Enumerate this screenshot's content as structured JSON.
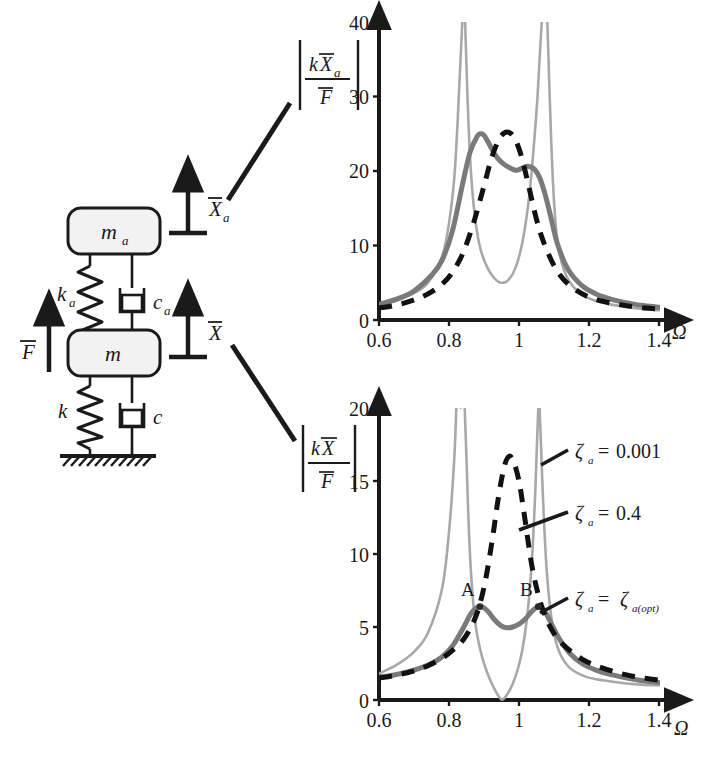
{
  "figure": {
    "colors": {
      "curve_light": "#a8a8a8",
      "curve_dark": "#7a7a7a",
      "curve_dashed": "#111111",
      "axis": "#1a1a1a",
      "mass_fill": "#f2f2f2",
      "stroke": "#1a1a1a"
    }
  },
  "schematic": {
    "name": "two-degree-of-freedom vibration absorber",
    "absorber_mass_label": "m",
    "absorber_mass_sub": "a",
    "absorber_spring_label": "k",
    "absorber_spring_sub": "a",
    "absorber_damper_label": "c",
    "absorber_damper_sub": "a",
    "primary_mass_label": "m",
    "primary_spring_label": "k",
    "primary_damper_label": "c",
    "force_label": "F",
    "disp_absorber_label": "X",
    "disp_absorber_sub": "a",
    "disp_primary_label": "X"
  },
  "chart_data": [
    {
      "id": "top",
      "type": "line",
      "title": "",
      "ylabel_parts": {
        "num_k": "k",
        "num_X": "X",
        "num_sub": "a",
        "den": "F"
      },
      "ylabel": "|kX_a / F|",
      "xlabel": "Ω",
      "xlim": [
        0.6,
        1.4
      ],
      "ylim": [
        0,
        40
      ],
      "xticks": [
        "0.6",
        "0.8",
        "1",
        "1.2",
        "1.4"
      ],
      "xtick_values": [
        0.6,
        0.8,
        1.0,
        1.2,
        1.4
      ],
      "yticks": [
        "0",
        "10",
        "20",
        "30",
        "40"
      ],
      "ytick_values": [
        0,
        10,
        20,
        30,
        40
      ],
      "grid": false,
      "series": [
        {
          "name": "ζa = 0.001",
          "style": "solid-light",
          "color": "#a8a8a8",
          "x": [
            0.6,
            0.65,
            0.7,
            0.74,
            0.78,
            0.8,
            0.815,
            0.825,
            0.832,
            0.838,
            0.842,
            0.846,
            0.85,
            0.856,
            0.864,
            0.875,
            0.89,
            0.91,
            0.93,
            0.95,
            0.97,
            0.99,
            1.01,
            1.03,
            1.05,
            1.06,
            1.068,
            1.074,
            1.079,
            1.083,
            1.087,
            1.092,
            1.1,
            1.11,
            1.13,
            1.16,
            1.2,
            1.25,
            1.3,
            1.35,
            1.4
          ],
          "y": [
            2.0,
            2.6,
            3.6,
            5.0,
            8.5,
            13.0,
            19.0,
            27.0,
            34.0,
            40.0,
            44.0,
            40.0,
            34.0,
            26.0,
            19.0,
            13.5,
            9.5,
            7.0,
            5.6,
            5.0,
            5.4,
            7.0,
            10.5,
            17.0,
            28.0,
            36.0,
            42.0,
            44.0,
            42.0,
            37.0,
            31.0,
            24.0,
            16.0,
            10.5,
            6.5,
            4.2,
            2.9,
            2.2,
            1.8,
            1.5,
            1.3
          ]
        },
        {
          "name": "ζa = ζa(opt)",
          "style": "solid-dark",
          "color": "#7a7a7a",
          "x": [
            0.6,
            0.65,
            0.7,
            0.75,
            0.78,
            0.81,
            0.84,
            0.86,
            0.88,
            0.89,
            0.9,
            0.915,
            0.93,
            0.945,
            0.96,
            0.975,
            0.99,
            1.0,
            1.01,
            1.02,
            1.03,
            1.045,
            1.06,
            1.075,
            1.09,
            1.11,
            1.14,
            1.18,
            1.22,
            1.27,
            1.32,
            1.36,
            1.4
          ],
          "y": [
            2.1,
            2.8,
            3.9,
            6.0,
            8.0,
            12.0,
            18.5,
            22.5,
            24.6,
            25.0,
            24.8,
            23.6,
            22.3,
            21.4,
            20.8,
            20.4,
            20.1,
            20.2,
            20.4,
            20.6,
            20.6,
            20.2,
            19.0,
            16.8,
            14.0,
            10.2,
            6.8,
            4.6,
            3.5,
            2.7,
            2.2,
            1.9,
            1.7
          ]
        },
        {
          "name": "ζa = 0.4",
          "style": "dashed",
          "color": "#111111",
          "x": [
            0.6,
            0.65,
            0.7,
            0.74,
            0.78,
            0.81,
            0.84,
            0.87,
            0.9,
            0.92,
            0.94,
            0.955,
            0.97,
            0.985,
            1.0,
            1.015,
            1.03,
            1.05,
            1.07,
            1.1,
            1.13,
            1.17,
            1.21,
            1.26,
            1.31,
            1.36,
            1.4
          ],
          "y": [
            1.6,
            2.0,
            2.7,
            3.5,
            4.8,
            6.4,
            9.0,
            13.0,
            18.0,
            21.5,
            24.0,
            25.0,
            25.2,
            24.6,
            23.0,
            20.5,
            17.5,
            13.5,
            10.5,
            7.3,
            5.3,
            3.8,
            2.9,
            2.3,
            1.9,
            1.6,
            1.5
          ]
        }
      ]
    },
    {
      "id": "bottom",
      "type": "line",
      "title": "",
      "ylabel_parts": {
        "num_k": "k",
        "num_X": "X",
        "den": "F"
      },
      "ylabel": "|kX / F|",
      "xlabel": "Ω",
      "xlim": [
        0.6,
        1.4
      ],
      "ylim": [
        0,
        20
      ],
      "xticks": [
        "0.6",
        "0.8",
        "1",
        "1.2",
        "1.4"
      ],
      "xtick_values": [
        0.6,
        0.8,
        1.0,
        1.2,
        1.4
      ],
      "yticks": [
        "0",
        "5",
        "10",
        "15",
        "20"
      ],
      "ytick_values": [
        0,
        5,
        10,
        15,
        20
      ],
      "grid": false,
      "annotations": [
        {
          "text": "A",
          "x": 0.888,
          "y": 6.4
        },
        {
          "text": "B",
          "x": 1.055,
          "y": 6.4
        }
      ],
      "series": [
        {
          "name": "ζa = 0.001",
          "style": "solid-light",
          "color": "#a8a8a8",
          "x": [
            0.6,
            0.65,
            0.7,
            0.74,
            0.78,
            0.8,
            0.815,
            0.825,
            0.833,
            0.84,
            0.845,
            0.85,
            0.857,
            0.866,
            0.878,
            0.895,
            0.912,
            0.928,
            0.94,
            0.948,
            0.952,
            0.958,
            0.968,
            0.982,
            1.0,
            1.015,
            1.028,
            1.038,
            1.046,
            1.052,
            1.057,
            1.062,
            1.07,
            1.08,
            1.095,
            1.115,
            1.145,
            1.19,
            1.24,
            1.3,
            1.35,
            1.4
          ],
          "y": [
            1.8,
            2.4,
            3.3,
            4.6,
            7.6,
            11.5,
            16.5,
            22.0,
            20.0,
            22.0,
            20.0,
            16.5,
            11.5,
            7.6,
            4.8,
            2.9,
            1.7,
            0.85,
            0.32,
            0.08,
            0.02,
            0.12,
            0.45,
            1.1,
            2.4,
            4.2,
            6.8,
            10.0,
            14.0,
            18.0,
            20.5,
            18.0,
            13.0,
            8.6,
            5.2,
            3.3,
            2.2,
            1.6,
            1.35,
            1.15,
            1.05,
            1.0
          ]
        },
        {
          "name": "ζa = ζa(opt)",
          "style": "solid-dark",
          "color": "#7a7a7a",
          "x": [
            0.6,
            0.65,
            0.7,
            0.74,
            0.78,
            0.81,
            0.84,
            0.862,
            0.878,
            0.888,
            0.898,
            0.912,
            0.93,
            0.948,
            0.965,
            0.982,
            1.0,
            1.018,
            1.032,
            1.045,
            1.055,
            1.065,
            1.078,
            1.095,
            1.115,
            1.145,
            1.18,
            1.22,
            1.27,
            1.32,
            1.36,
            1.4
          ],
          "y": [
            1.55,
            1.75,
            2.05,
            2.4,
            2.95,
            3.7,
            4.9,
            5.9,
            6.3,
            6.4,
            6.35,
            6.05,
            5.5,
            5.1,
            4.95,
            5.0,
            5.2,
            5.55,
            5.95,
            6.25,
            6.4,
            6.3,
            5.9,
            5.1,
            4.2,
            3.2,
            2.5,
            2.05,
            1.7,
            1.45,
            1.3,
            1.2
          ]
        },
        {
          "name": "ζa = 0.4",
          "style": "dashed",
          "color": "#111111",
          "x": [
            0.6,
            0.65,
            0.7,
            0.74,
            0.78,
            0.81,
            0.84,
            0.865,
            0.885,
            0.905,
            0.925,
            0.942,
            0.958,
            0.972,
            0.985,
            1.0,
            1.012,
            1.024,
            1.036,
            1.05,
            1.065,
            1.085,
            1.11,
            1.14,
            1.18,
            1.22,
            1.27,
            1.32,
            1.36,
            1.4
          ],
          "y": [
            1.5,
            1.7,
            2.0,
            2.35,
            2.85,
            3.4,
            4.1,
            5.1,
            6.3,
            8.3,
            11.2,
            14.0,
            16.0,
            16.7,
            16.3,
            15.0,
            13.2,
            11.2,
            9.3,
            7.7,
            6.4,
            5.2,
            4.2,
            3.5,
            2.8,
            2.35,
            1.95,
            1.65,
            1.5,
            1.35
          ]
        }
      ]
    }
  ],
  "legend": {
    "position": "right",
    "entries": [
      {
        "zeta": "ζ",
        "sub": "a",
        "eq": "=",
        "value": "0.001"
      },
      {
        "zeta": "ζ",
        "sub": "a",
        "eq": "=",
        "value": "0.4"
      },
      {
        "zeta": "ζ",
        "sub": "a",
        "eq": "=",
        "value_zeta": "ζ",
        "value_sub": "a(opt)"
      }
    ],
    "labels": [
      "ζa = 0.001",
      "ζa = 0.4",
      "ζa = ζa(opt)"
    ]
  }
}
